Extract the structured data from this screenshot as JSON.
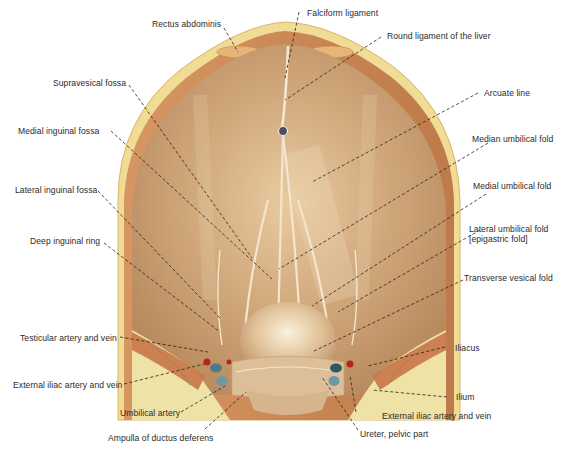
{
  "figure": {
    "colors": {
      "peritoneum": "#c9a178",
      "peritoneum_light": "#e8cfa8",
      "muscle": "#c0774a",
      "fat": "#f0dc8e",
      "bone": "#efe3a8",
      "vein": "#4e7a8a",
      "artery": "#b3261e",
      "leader": "#2a2218",
      "text": "#2b2b2b"
    }
  },
  "labels": {
    "rectus_abdominis": "Rectus abdominis",
    "falciform_ligament": "Falciform ligament",
    "round_ligament": "Round ligament of the liver",
    "supravesical_fossa": "Supravesical fossa",
    "arcuate_line": "Arcuate line",
    "medial_inguinal_fossa": "Medial inguinal fossa",
    "median_umbilical_fold": "Median umbilical fold",
    "lateral_inguinal_fossa": "Lateral inguinal fossa",
    "medial_umbilical_fold": "Medial umbilical fold",
    "lateral_umbilical_fold_1": "Lateral umbilical fold",
    "lateral_umbilical_fold_2": "[epigastric fold]",
    "deep_inguinal_ring": "Deep inguinal ring",
    "transverse_vesical_fold": "Transverse vesical fold",
    "testicular_artery_vein": "Testicular artery and vein",
    "iliacus": "Iliacus",
    "external_iliac_left": "External iliac artery and vein",
    "ilium": "Ilium",
    "umbilical_artery": "Umbilical artery",
    "external_iliac_right": "External iliac artery and vein",
    "ampulla_ductus_deferens": "Ampulla of ductus deferens",
    "ureter_pelvic_part": "Ureter, pelvic part"
  }
}
